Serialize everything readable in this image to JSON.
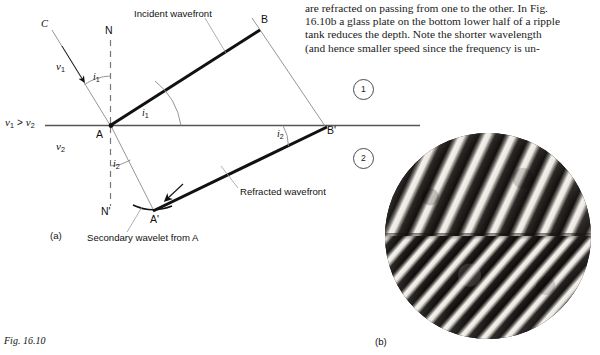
{
  "figure": {
    "number_label": "Fig. 16.10",
    "panel_a_label": "(a)",
    "panel_b_label": "(b)"
  },
  "body_text": {
    "lines": [
      "are refracted on passing from one to the other. In Fig.",
      "16.10b a glass plate on the bottom lower half of a ripple",
      "tank reduces the depth. Note the shorter wavelength",
      "(and hence smaller speed since the frequency is un-"
    ]
  },
  "diagram": {
    "points": {
      "C": "C",
      "N": "N",
      "N_prime": "N'",
      "A": "A",
      "A_prime": "A'",
      "B": "B",
      "B_prime": "B'"
    },
    "speeds": {
      "v1": "v",
      "v1_sub": "1",
      "v2": "v",
      "v2_sub": "2",
      "inequality": "v₁ > v₂"
    },
    "angles": {
      "i1_upper": "i",
      "i1_upper_sub": "1",
      "i1_lower": "i",
      "i1_lower_sub": "1",
      "i2_left": "i",
      "i2_left_sub": "2",
      "i2_right": "i",
      "i2_right_sub": "2"
    },
    "annotations": {
      "incident_wavefront": "Incident wavefront",
      "refracted_wavefront": "Refracted wavefront",
      "secondary_wavelet": "Secondary wavelet from A"
    },
    "region_markers": {
      "one": "1",
      "two": "2"
    },
    "colors": {
      "ink": "#111111",
      "thin_line": "#7a7a7a",
      "interface": "#555555",
      "circle_stroke": "#4a4a4a"
    }
  },
  "photo": {
    "caption": "(b)",
    "description": "ripple-tank-refraction-photograph"
  }
}
